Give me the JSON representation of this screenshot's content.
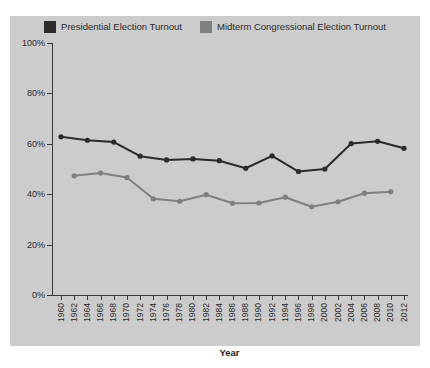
{
  "legend": {
    "position": "top-center",
    "entries": [
      {
        "label": "Presidential Election Turnout",
        "color": "#2b2b2b",
        "swatch_name": "legend-swatch-presidential"
      },
      {
        "label": "Midterm Congressional Election Turnout",
        "color": "#808080",
        "swatch_name": "legend-swatch-midterm"
      }
    ]
  },
  "axes": {
    "x_title": "Year",
    "y_ticks": [
      "0%",
      "20%",
      "40%",
      "60%",
      "80%",
      "100%"
    ],
    "x_ticks": [
      "1960",
      "1962",
      "1964",
      "1966",
      "1968",
      "1970",
      "1972",
      "1974",
      "1976",
      "1978",
      "1980",
      "1982",
      "1984",
      "1986",
      "1988",
      "1990",
      "1992",
      "1994",
      "1996",
      "1998",
      "2000",
      "2002",
      "2004",
      "2006",
      "2008",
      "2010",
      "2012"
    ]
  },
  "colors": {
    "background": "#cccccc",
    "page": "#ffffff",
    "presidential": "#2b2b2b",
    "midterm": "#808080",
    "axis": "#3a3a3a",
    "text": "#2b2b2b"
  },
  "chart_data": {
    "type": "line",
    "title": "",
    "subtitle": "",
    "xlabel": "Year",
    "ylabel": "",
    "grid": false,
    "legend_position": "top-center",
    "ylim": [
      0,
      100
    ],
    "ytick_values": [
      0,
      20,
      40,
      60,
      80,
      100
    ],
    "ytick_labels": [
      "0%",
      "20%",
      "40%",
      "60%",
      "80%",
      "100%"
    ],
    "xlim": [
      1960,
      2012
    ],
    "x": [
      1960,
      1962,
      1964,
      1966,
      1968,
      1970,
      1972,
      1974,
      1976,
      1978,
      1980,
      1982,
      1984,
      1986,
      1988,
      1990,
      1992,
      1994,
      1996,
      1998,
      2000,
      2002,
      2004,
      2006,
      2008,
      2010,
      2012
    ],
    "series": [
      {
        "name": "Presidential Election Turnout",
        "color": "#2b2b2b",
        "marker": "circle",
        "points": [
          {
            "x": 1960,
            "y": 62.8
          },
          {
            "x": 1964,
            "y": 61.4
          },
          {
            "x": 1968,
            "y": 60.7
          },
          {
            "x": 1972,
            "y": 55.1
          },
          {
            "x": 1976,
            "y": 53.6
          },
          {
            "x": 1980,
            "y": 54.0
          },
          {
            "x": 1984,
            "y": 53.3
          },
          {
            "x": 1988,
            "y": 50.3
          },
          {
            "x": 1992,
            "y": 55.2
          },
          {
            "x": 1996,
            "y": 49.0
          },
          {
            "x": 2000,
            "y": 50.0
          },
          {
            "x": 2004,
            "y": 60.1
          },
          {
            "x": 2008,
            "y": 61.0
          },
          {
            "x": 2012,
            "y": 58.2
          }
        ]
      },
      {
        "name": "Midterm Congressional Election Turnout",
        "color": "#808080",
        "marker": "circle",
        "points": [
          {
            "x": 1962,
            "y": 47.3
          },
          {
            "x": 1966,
            "y": 48.4
          },
          {
            "x": 1970,
            "y": 46.6
          },
          {
            "x": 1974,
            "y": 38.2
          },
          {
            "x": 1978,
            "y": 37.2
          },
          {
            "x": 1982,
            "y": 39.8
          },
          {
            "x": 1986,
            "y": 36.4
          },
          {
            "x": 1990,
            "y": 36.5
          },
          {
            "x": 1994,
            "y": 38.8
          },
          {
            "x": 1998,
            "y": 35.0
          },
          {
            "x": 2002,
            "y": 37.0
          },
          {
            "x": 2006,
            "y": 40.4
          },
          {
            "x": 2010,
            "y": 41.0
          }
        ]
      }
    ]
  }
}
